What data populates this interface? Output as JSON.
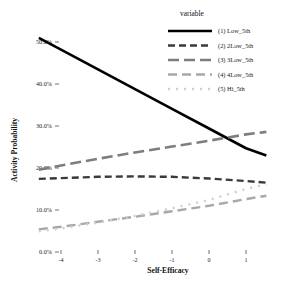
{
  "chart_data": {
    "type": "line",
    "title": "",
    "xlabel": "Self-Efficacy",
    "ylabel": "Activity Probability",
    "legend_title": "variable",
    "legend_position": "top-right",
    "grid": false,
    "xlim": [
      -4.6,
      1.55
    ],
    "ylim": [
      0,
      52
    ],
    "xticks": [
      -4,
      -3,
      -2,
      -1,
      0,
      1
    ],
    "xticklabels": [
      "-4",
      "-3",
      "-2",
      "-1",
      "0",
      "1"
    ],
    "yticks": [
      0,
      10,
      20,
      30,
      40,
      50
    ],
    "yticklabels": [
      "0.0%",
      "10.0%",
      "20.0%",
      "30.0%",
      "40.0%",
      "50.0%"
    ],
    "y_unit": "percent",
    "x": [
      -4.6,
      -4,
      -3,
      -2,
      -1,
      0,
      1,
      1.55
    ],
    "series": [
      {
        "name": "(1) Low_5th",
        "key": "low_5th",
        "color": "#000000",
        "linestyle": "solid",
        "dasharray": "",
        "width": 2.6,
        "values": [
          51.0,
          48.2,
          43.5,
          38.8,
          34.1,
          29.4,
          24.7,
          23.0
        ]
      },
      {
        "name": "(2) 2Low_5th",
        "key": "2low_5th",
        "color": "#3a3a3a",
        "linestyle": "dashed",
        "dasharray": "7,4",
        "width": 2.4,
        "values": [
          17.4,
          17.6,
          17.9,
          18.0,
          17.9,
          17.5,
          16.9,
          16.5
        ]
      },
      {
        "name": "(3) 3Low_5th",
        "key": "3low_5th",
        "color": "#7d7d7d",
        "linestyle": "long-dash",
        "dasharray": "11,5",
        "width": 2.6,
        "values": [
          19.6,
          20.6,
          22.2,
          23.7,
          25.1,
          26.5,
          28.0,
          28.6
        ]
      },
      {
        "name": "(4) 4Low_5th",
        "key": "4low_5th",
        "color": "#a8a8a8",
        "linestyle": "dash",
        "dasharray": "9,5",
        "width": 2.4,
        "values": [
          5.4,
          6.0,
          7.2,
          8.4,
          9.7,
          11.0,
          12.6,
          13.4
        ]
      },
      {
        "name": "(5) Hi_5th",
        "key": "hi_5th",
        "color": "#cfcfcf",
        "linestyle": "dotted",
        "dasharray": "2,6",
        "width": 2.4,
        "values": [
          4.9,
          5.6,
          7.0,
          8.6,
          10.4,
          12.4,
          15.0,
          16.2
        ]
      }
    ]
  },
  "axes": {
    "x_title": "Self-Efficacy",
    "y_title": "Activity Probability"
  },
  "legend": {
    "title": "variable",
    "entries": [
      {
        "label": "(1) Low_5th"
      },
      {
        "label": "(2) 2Low_5th"
      },
      {
        "label": "(3) 3Low_5th"
      },
      {
        "label": "(4) 4Low_5th"
      },
      {
        "label": "(5) Hi_5th"
      }
    ]
  }
}
